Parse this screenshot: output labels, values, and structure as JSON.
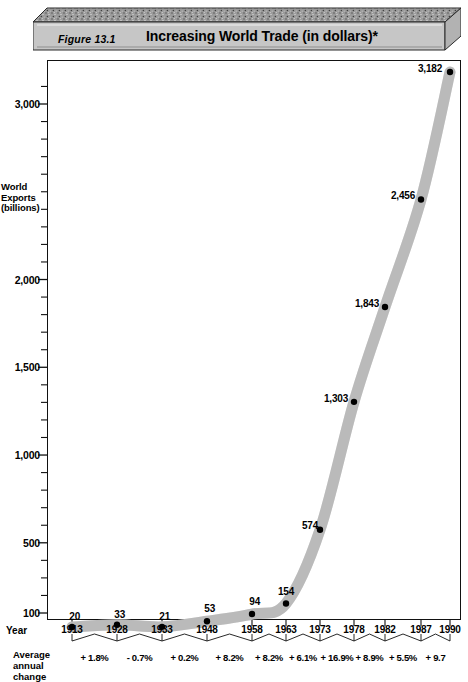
{
  "header": {
    "figure_number": "Figure 13.1",
    "title": "Increasing World Trade  (in dollars)*"
  },
  "axes": {
    "y_title_line1": "World",
    "y_title_line2": "Exports",
    "y_title_line3": "(billions)",
    "x_title": "Year",
    "pct_title_line1": "Average",
    "pct_title_line2": "annual",
    "pct_title_line3": "change"
  },
  "colors": {
    "curve": "#c4c4c4",
    "curve_edge": "#a8a8a8",
    "point": "#000000",
    "frame": "#111111",
    "plaque_top": "#8a8a8a",
    "plaque_face": "#c8c8c8"
  },
  "chart_data": {
    "type": "line",
    "title": "Increasing World Trade  (in dollars)*",
    "xlabel": "Year",
    "ylabel": "World Exports (billions)",
    "grid": false,
    "legend": null,
    "ylim": [
      100,
      3182
    ],
    "yticks": [
      {
        "value": 3000,
        "label": "3,000"
      },
      {
        "value": 2000,
        "label": "2,000"
      },
      {
        "value": 1500,
        "label": "1,500"
      },
      {
        "value": 1000,
        "label": "1,000"
      },
      {
        "value": 500,
        "label": "500"
      },
      {
        "value": 100,
        "label": "100"
      }
    ],
    "minor_tick_count_per_interval": 4,
    "categories": [
      "1913",
      "1928",
      "1933",
      "1948",
      "1958",
      "1963",
      "1973",
      "1978",
      "1982",
      "1987",
      "1990"
    ],
    "values": [
      20,
      33,
      21,
      53,
      94,
      154,
      574,
      1303,
      1843,
      2456,
      3182
    ],
    "point_labels": [
      "20",
      "33",
      "21",
      "53",
      "94",
      "154",
      "574",
      "1,303",
      "1,843",
      "2,456",
      "3,182"
    ],
    "annual_change": [
      "+ 1.8%",
      "- 0.7%",
      "+ 0.2%",
      "+ 8.2%",
      "+ 8.2%",
      "+ 6.1%",
      "+ 16.9%",
      "+ 8.9%",
      "+ 5.5%",
      "+ 9.7"
    ],
    "annual_change_intervals": [
      "1913-1928",
      "1928-1933",
      "1933-1948",
      "1948-1958",
      "1958-1963",
      "1963-1973",
      "1973-1978",
      "1978-1982",
      "1982-1987",
      "1987-1990"
    ]
  }
}
